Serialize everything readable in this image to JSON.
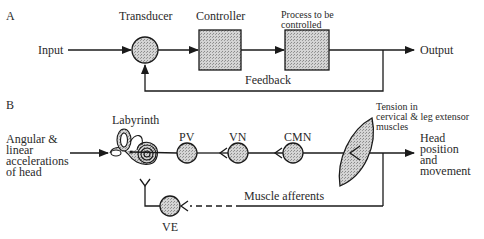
{
  "panel_a": {
    "label": "A",
    "input": "Input",
    "transducer": "Transducer",
    "controller": "Controller",
    "process": "Process to be controlled",
    "process_line1": "Process to be",
    "process_line2": "controlled",
    "output": "Output",
    "feedback": "Feedback"
  },
  "panel_b": {
    "label": "B",
    "input_line1": "Angular &",
    "input_line2": "linear",
    "input_line3": "accelerations",
    "input_line4": "of head",
    "labyrinth": "Labyrinth",
    "pv": "PV",
    "vn": "VN",
    "cmn": "CMN",
    "ve": "VE",
    "tension_line1": "Tension in",
    "tension_line2": "cervical & leg extensor",
    "tension_line3": "muscles",
    "output_line1": "Head",
    "output_line2": "position",
    "output_line3": "and",
    "output_line4": "movement",
    "muscle_afferents": "Muscle afferents"
  },
  "colors": {
    "stroke": "#1a1a1a",
    "fill_stipple": "#bdbdbd",
    "background": "#ffffff"
  }
}
